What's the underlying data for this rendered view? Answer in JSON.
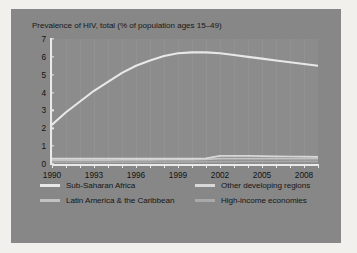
{
  "chart_data": {
    "type": "line",
    "title": "Prevalence of HIV, total (% of population ages 15–49)",
    "xlabel": "",
    "ylabel": "",
    "xlim": [
      1990,
      2009
    ],
    "ylim": [
      0,
      7
    ],
    "xticks": [
      1990,
      1993,
      1996,
      1999,
      2002,
      2005,
      2008
    ],
    "yticks": [
      0,
      1,
      2,
      3,
      4,
      5,
      6,
      7
    ],
    "grid": "vertical-faint",
    "legend_position": "bottom",
    "x": [
      1990,
      1991,
      1992,
      1993,
      1994,
      1995,
      1996,
      1997,
      1998,
      1999,
      2000,
      2001,
      2002,
      2003,
      2004,
      2005,
      2006,
      2007,
      2008,
      2009
    ],
    "series": [
      {
        "name": "Sub-Saharan Africa",
        "color": "#e8e8e8",
        "values": [
          2.2,
          2.9,
          3.5,
          4.1,
          4.6,
          5.1,
          5.5,
          5.8,
          6.05,
          6.2,
          6.25,
          6.25,
          6.2,
          6.1,
          6.0,
          5.9,
          5.8,
          5.7,
          5.6,
          5.5
        ]
      },
      {
        "name": "Other developing regions",
        "color": "#d8d8d8",
        "values": [
          0.3,
          0.3,
          0.3,
          0.3,
          0.3,
          0.3,
          0.3,
          0.3,
          0.3,
          0.3,
          0.3,
          0.32,
          0.45,
          0.45,
          0.45,
          0.44,
          0.43,
          0.42,
          0.41,
          0.4
        ]
      },
      {
        "name": "Latin America & the Caribbean",
        "color": "#c2c2c2",
        "values": [
          0.22,
          0.22,
          0.22,
          0.22,
          0.22,
          0.23,
          0.23,
          0.23,
          0.24,
          0.24,
          0.25,
          0.26,
          0.3,
          0.3,
          0.3,
          0.3,
          0.3,
          0.3,
          0.3,
          0.3
        ]
      },
      {
        "name": "High-income economies",
        "color": "#a8a8a8",
        "values": [
          0.1,
          0.1,
          0.1,
          0.1,
          0.1,
          0.1,
          0.1,
          0.1,
          0.11,
          0.11,
          0.12,
          0.12,
          0.13,
          0.13,
          0.14,
          0.14,
          0.14,
          0.15,
          0.15,
          0.15
        ]
      }
    ]
  },
  "legend": {
    "items": [
      {
        "label": "Sub-Saharan Africa",
        "color": "#e8e8e8"
      },
      {
        "label": "Other developing regions",
        "color": "#d8d8d8"
      },
      {
        "label": "Latin America & the Caribbean",
        "color": "#c2c2c2"
      },
      {
        "label": "High-income economies",
        "color": "#a8a8a8"
      }
    ]
  },
  "colors": {
    "page_background": "#f2f0ec",
    "card_background": "#878787",
    "plot_background": "#8c8c8c",
    "axis": "#e9e9e9",
    "text": "#151515"
  }
}
